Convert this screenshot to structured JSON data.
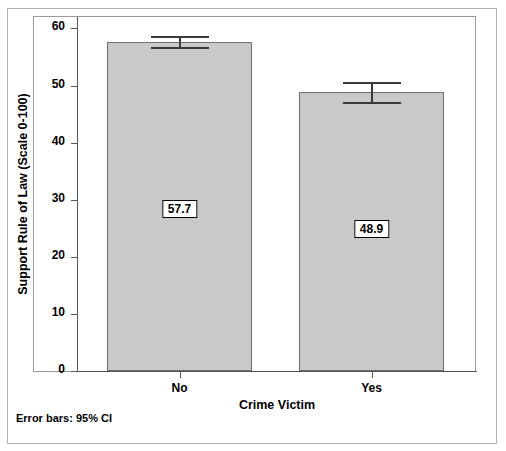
{
  "chart_data": {
    "type": "bar",
    "title": "",
    "subtitle": "",
    "xlabel": "Crime Victim",
    "ylabel": "Support Rule of Law (Scale 0-100)",
    "categories": [
      "No",
      "Yes"
    ],
    "values": [
      57.7,
      48.9
    ],
    "data_labels": [
      "57.7",
      "48.9"
    ],
    "error_bars": {
      "caption": "Error bars: 95% CI",
      "confidence": "95% CI",
      "lower": [
        56.8,
        47.1
      ],
      "upper": [
        58.6,
        50.6
      ]
    },
    "ylim": [
      0,
      62
    ],
    "yticks": [
      0,
      10,
      20,
      30,
      40,
      50,
      60
    ],
    "ytick_labels": [
      "0",
      "10",
      "20",
      "30",
      "40",
      "50",
      "60"
    ],
    "grid": false,
    "legend": "none",
    "bar_fill_color": "#c9c9c9",
    "bar_edge_color": "#6e6e6e",
    "error_bar_color": "#3a3a3a",
    "background_color": "#ffffff"
  }
}
